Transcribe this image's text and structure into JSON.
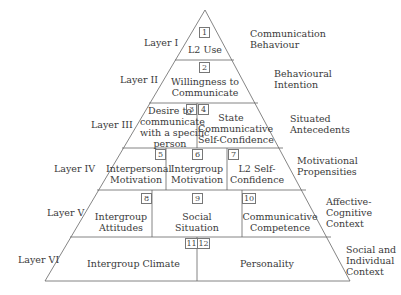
{
  "layers": [
    {
      "name": "Layer I",
      "category": [
        "Communication",
        "Behaviour"
      ],
      "boxes": [
        {
          "num": "1",
          "text": [
            "L2 Use"
          ]
        }
      ]
    },
    {
      "name": "Layer II",
      "category": [
        "Behavioural",
        "Intention"
      ],
      "boxes": [
        {
          "num": "2",
          "text": [
            "Willingness to",
            "Communicate"
          ]
        }
      ]
    },
    {
      "name": "Layer III",
      "category": [
        "Situated",
        "Antecedents"
      ],
      "boxes": [
        {
          "num": "3",
          "text": [
            "Desire to",
            "communicate",
            "with a specific",
            "person"
          ]
        },
        {
          "num": "4",
          "text": [
            "State",
            "Communicative",
            "Self-Confidence"
          ]
        }
      ]
    },
    {
      "name": "Layer IV",
      "category": [
        "Motivational",
        "Propensities"
      ],
      "boxes": [
        {
          "num": "5",
          "text": [
            "Interpersonal",
            "Motivation"
          ]
        },
        {
          "num": "6",
          "text": [
            "Intergroup",
            "Motivation"
          ]
        },
        {
          "num": "7",
          "text": [
            "L2 Self-",
            "Confidence"
          ]
        }
      ]
    },
    {
      "name": "Layer V",
      "category": [
        "Affective-",
        "Cognitive",
        "Context"
      ],
      "boxes": [
        {
          "num": "8",
          "text": [
            "Intergroup",
            "Attitudes"
          ]
        },
        {
          "num": "9",
          "text": [
            "Social",
            "Situation"
          ]
        },
        {
          "num": "10",
          "text": [
            "Communicative",
            "Competence"
          ]
        }
      ]
    },
    {
      "name": "Layer VI",
      "category": [
        "Social and",
        "Individual",
        "Context"
      ],
      "boxes": [
        {
          "num": "11",
          "text": [
            "Intergroup Climate"
          ]
        },
        {
          "num": "12",
          "text": [
            "Personality"
          ]
        }
      ]
    }
  ],
  "colors": {
    "line": "#555555",
    "text": "#3a3a3a",
    "background": "#ffffff"
  }
}
